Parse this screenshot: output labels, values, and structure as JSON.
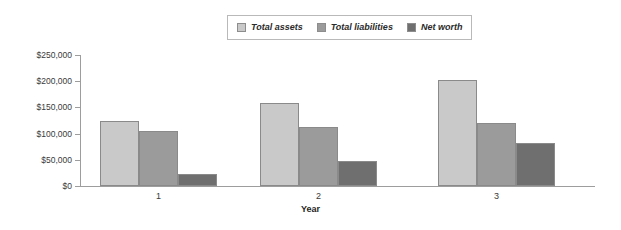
{
  "chart_data": {
    "type": "bar",
    "title": "",
    "xlabel": "Year",
    "ylabel": "",
    "categories": [
      "1",
      "2",
      "3"
    ],
    "series": [
      {
        "name": "Total assets",
        "color": "#c9c9c9",
        "values": [
          125000,
          158000,
          202000
        ]
      },
      {
        "name": "Total liabilities",
        "color": "#9b9b9b",
        "values": [
          105000,
          113000,
          120000
        ]
      },
      {
        "name": "Net worth",
        "color": "#6f6f6f",
        "values": [
          22000,
          47000,
          83000
        ]
      }
    ],
    "ylim": [
      0,
      250000
    ],
    "yticks": [
      0,
      50000,
      100000,
      150000,
      200000,
      250000
    ],
    "ytick_labels": [
      "$0",
      "$50,000",
      "$100,000",
      "$150,000",
      "$200,000",
      "$250,000"
    ],
    "grid": false,
    "legend_position": "top-center",
    "legend_entries": [
      "Total assets",
      "Total liabilities",
      "Net worth"
    ]
  },
  "axis": {
    "x_title": "Year"
  }
}
